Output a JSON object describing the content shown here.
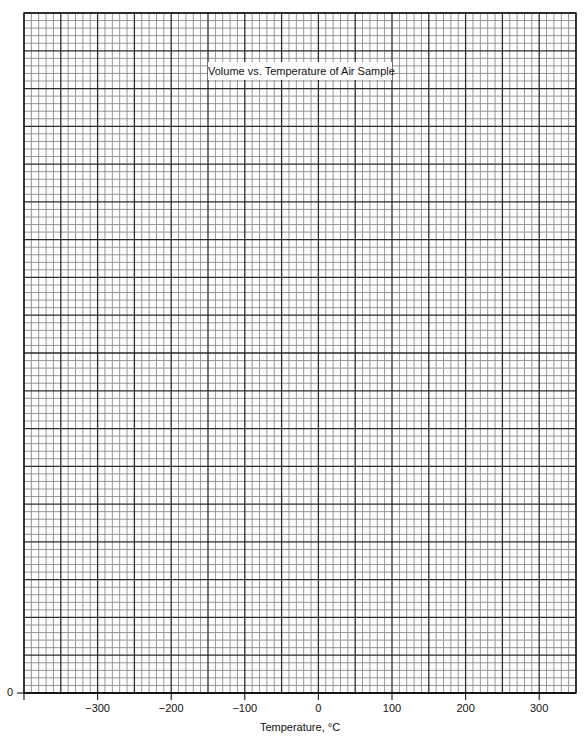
{
  "chart_data": {
    "type": "line",
    "title": "Volume vs. Temperature of Air Sample",
    "xlabel": "Temperature, °C",
    "ylabel": "",
    "xlim": [
      -400,
      350
    ],
    "ylim": [
      0,
      null
    ],
    "x_ticks": [
      -300,
      -200,
      -100,
      0,
      100,
      200,
      300
    ],
    "x_tick_labels": [
      "−300",
      "−200",
      "−100",
      "0",
      "100",
      "200",
      "300"
    ],
    "y_ticks": [
      0
    ],
    "y_tick_labels": [
      "0"
    ],
    "series": [],
    "grid": true,
    "grid_style": {
      "major_columns": 15,
      "major_rows": 18,
      "minor_per_major": 5,
      "major_x_step": 50
    },
    "legend": null,
    "note": "Blank graph paper with no plotted data points"
  },
  "layout": {
    "plot_left": 24,
    "plot_top": 13,
    "plot_right": 576,
    "plot_bottom": 693,
    "colors": {
      "minor_line": "#8a8a8a",
      "major_line": "#2a2a2a",
      "background": "#ffffff",
      "text": "#111111"
    }
  },
  "labels": {
    "title": "Volume vs. Temperature of Air Sample",
    "x_axis": "Temperature, °C",
    "y_zero": "0"
  }
}
